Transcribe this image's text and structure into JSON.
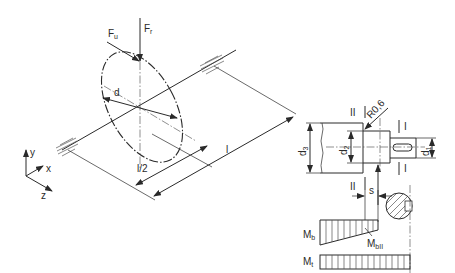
{
  "figure": {
    "type": "technical-drawing"
  },
  "labels": {
    "force_radial": "F",
    "force_radial_sub": "r",
    "force_tangential": "F",
    "force_tangential_sub": "u",
    "diameter_disk": "d",
    "length": "l",
    "half_length": "l/2",
    "axis_y": "y",
    "axis_x": "x",
    "axis_z": "z",
    "d3": "d",
    "d3_sub": "3",
    "d2": "d",
    "d2_sub": "2",
    "d1": "d",
    "d1_sub": "1",
    "radius": "R0,6",
    "section_I_top": "I",
    "section_I_bottom": "I",
    "section_II_top": "II",
    "section_II_bottom": "II",
    "offset_s": "s",
    "moment_bending": "M",
    "moment_bending_sub": "b",
    "moment_bending_II": "M",
    "moment_bending_II_sub": "bII",
    "moment_torsion": "M",
    "moment_torsion_sub": "t"
  },
  "colors": {
    "ink": "#2a2a2a",
    "background": "#ffffff"
  }
}
